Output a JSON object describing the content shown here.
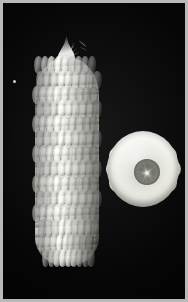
{
  "image": {
    "kind": "photograph",
    "subject": "corn",
    "color_mode": "grayscale",
    "orientation": "portrait",
    "width_px": 188,
    "height_px": 302,
    "caption": "Black-and-white photograph of a white corn ear shown whole beside a cross-section slice of a cob",
    "background_color": "#050505",
    "border_color": "#b9b9b9",
    "border_width_px": 3
  },
  "subjects": [
    {
      "id": "ear-of-corn",
      "label": "Ear of corn",
      "view": "longitudinal whole ear",
      "position": {
        "x": 30,
        "y": 33,
        "width": 68,
        "height": 230
      },
      "features": {
        "tip": "pointed tapered tip with silk strands",
        "base": "rounded blunt base",
        "kernel_rows": 14,
        "kernel_columns": 9,
        "kernel_color": "#f2f2ea",
        "shadow_color": "#2a2a27"
      }
    },
    {
      "id": "cob-cross-section",
      "label": "Cob cross-section",
      "view": "transverse slice",
      "position": {
        "x": 101,
        "y": 125,
        "width": 78,
        "height": 84
      },
      "features": {
        "lobe_count": 12,
        "core": "dark central cob pith with radiating fibers",
        "core_color": "#5c5c55",
        "lobe_color": "#efefe7"
      }
    },
    {
      "id": "speck",
      "label": "Small bright speck",
      "view": "dust mote on background",
      "position": {
        "x": 111,
        "y": 202,
        "width": 3,
        "height": 3
      }
    }
  ]
}
